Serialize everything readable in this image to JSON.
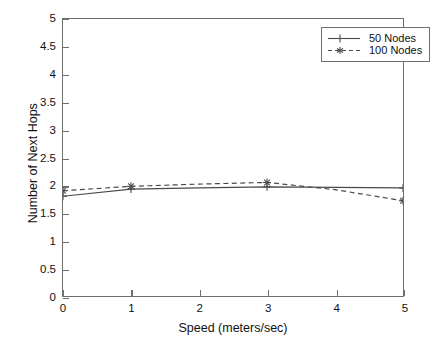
{
  "chart_data": {
    "type": "line",
    "title": "",
    "xlabel": "Speed (meters/sec)",
    "ylabel": "Number of Next Hops",
    "xlim": [
      0,
      5
    ],
    "ylim": [
      0,
      5
    ],
    "xticks": [
      "0",
      "1",
      "2",
      "3",
      "4",
      "5"
    ],
    "yticks": [
      "0",
      "0.5",
      "1",
      "1.5",
      "2",
      "2.5",
      "3",
      "3.5",
      "4",
      "4.5",
      "5"
    ],
    "xtick_values": [
      0,
      1,
      2,
      3,
      4,
      5
    ],
    "ytick_values": [
      0,
      0.5,
      1,
      1.5,
      2,
      2.5,
      3,
      3.5,
      4,
      4.5,
      5
    ],
    "grid": false,
    "legend_position": "top-right",
    "x": [
      0,
      1,
      2,
      3,
      4,
      5
    ],
    "series": [
      {
        "name": "50 Nodes",
        "values": [
          1.8,
          1.93,
          1.95,
          1.97,
          1.96,
          1.95
        ],
        "linestyle": "solid",
        "marker": "plus",
        "color": "#4a4a4a"
      },
      {
        "name": "100 Nodes",
        "values": [
          1.9,
          1.98,
          2.02,
          2.05,
          1.92,
          1.72
        ],
        "linestyle": "dashed",
        "marker": "star",
        "color": "#4a4a4a"
      }
    ]
  },
  "legend": {
    "entries": [
      {
        "label": "50 Nodes"
      },
      {
        "label": "100 Nodes"
      }
    ]
  },
  "colors": {
    "axis": "#6f6f6f",
    "line": "#4a4a4a",
    "background": "#ffffff",
    "text": "#111111"
  }
}
